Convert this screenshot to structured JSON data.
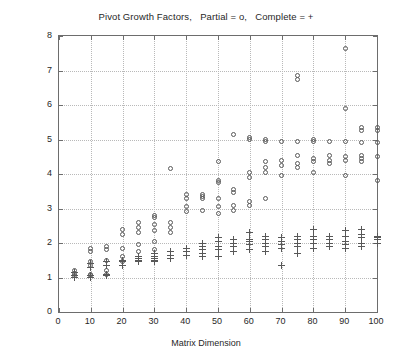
{
  "chart_data": {
    "type": "scatter",
    "title": "Pivot Growth Factors,   Partial = o,   Complete = +",
    "xlabel": "Matrix Dimension",
    "ylabel": "",
    "xlim": [
      0,
      100
    ],
    "ylim": [
      0,
      8
    ],
    "xticks": [
      0,
      10,
      20,
      30,
      40,
      50,
      60,
      70,
      80,
      90,
      100
    ],
    "yticks": [
      0,
      1,
      2,
      3,
      4,
      5,
      6,
      7,
      8
    ],
    "grid": true,
    "legend_position": "in-title",
    "marker_color": "#585858",
    "axis_color": "#6d6d6d",
    "grid_color": "#b9b9b9",
    "series": [
      {
        "name": "Partial",
        "marker": "o",
        "legend_text": "Partial = o",
        "points": [
          [
            5,
            1.05
          ],
          [
            5,
            1.12
          ],
          [
            5,
            1.2
          ],
          [
            10,
            1.05
          ],
          [
            10,
            1.1
          ],
          [
            10,
            1.35
          ],
          [
            10,
            1.45
          ],
          [
            10,
            1.75
          ],
          [
            10,
            1.85
          ],
          [
            15,
            1.1
          ],
          [
            15,
            1.2
          ],
          [
            15,
            1.5
          ],
          [
            15,
            1.8
          ],
          [
            15,
            1.9
          ],
          [
            20,
            1.45
          ],
          [
            20,
            1.6
          ],
          [
            20,
            1.85
          ],
          [
            20,
            2.25
          ],
          [
            20,
            2.4
          ],
          [
            25,
            1.75
          ],
          [
            25,
            1.95
          ],
          [
            25,
            2.3
          ],
          [
            25,
            2.45
          ],
          [
            25,
            2.6
          ],
          [
            30,
            1.8
          ],
          [
            30,
            2.05
          ],
          [
            30,
            2.35
          ],
          [
            30,
            2.55
          ],
          [
            30,
            2.75
          ],
          [
            30,
            2.8
          ],
          [
            35,
            2.3
          ],
          [
            35,
            2.45
          ],
          [
            35,
            2.6
          ],
          [
            35,
            4.15
          ],
          [
            40,
            2.9
          ],
          [
            40,
            3.05
          ],
          [
            40,
            3.3
          ],
          [
            40,
            3.4
          ],
          [
            45,
            2.95
          ],
          [
            45,
            3.3
          ],
          [
            45,
            3.35
          ],
          [
            45,
            3.4
          ],
          [
            50,
            2.85
          ],
          [
            50,
            3.05
          ],
          [
            50,
            3.3
          ],
          [
            50,
            3.75
          ],
          [
            50,
            3.8
          ],
          [
            50,
            4.35
          ],
          [
            55,
            2.95
          ],
          [
            55,
            3.1
          ],
          [
            55,
            3.45
          ],
          [
            55,
            3.55
          ],
          [
            55,
            5.15
          ],
          [
            60,
            3.1
          ],
          [
            60,
            3.2
          ],
          [
            60,
            3.9
          ],
          [
            60,
            4.05
          ],
          [
            60,
            5.0
          ],
          [
            60,
            5.05
          ],
          [
            65,
            3.3
          ],
          [
            65,
            4.05
          ],
          [
            65,
            4.2
          ],
          [
            65,
            4.35
          ],
          [
            65,
            4.95
          ],
          [
            65,
            5.0
          ],
          [
            70,
            3.95
          ],
          [
            70,
            4.25
          ],
          [
            70,
            4.4
          ],
          [
            70,
            4.95
          ],
          [
            75,
            4.2
          ],
          [
            75,
            4.3
          ],
          [
            75,
            4.55
          ],
          [
            75,
            4.95
          ],
          [
            75,
            6.75
          ],
          [
            75,
            6.85
          ],
          [
            80,
            4.05
          ],
          [
            80,
            4.35
          ],
          [
            80,
            4.45
          ],
          [
            80,
            4.95
          ],
          [
            80,
            5.0
          ],
          [
            85,
            4.3
          ],
          [
            85,
            4.4
          ],
          [
            85,
            4.55
          ],
          [
            85,
            4.95
          ],
          [
            90,
            3.95
          ],
          [
            90,
            4.4
          ],
          [
            90,
            4.5
          ],
          [
            90,
            4.95
          ],
          [
            90,
            5.9
          ],
          [
            90,
            7.65
          ],
          [
            95,
            4.35
          ],
          [
            95,
            4.45
          ],
          [
            95,
            4.55
          ],
          [
            95,
            4.9
          ],
          [
            95,
            5.25
          ],
          [
            95,
            5.35
          ],
          [
            100,
            3.8
          ],
          [
            100,
            4.5
          ],
          [
            100,
            4.9
          ],
          [
            100,
            5.25
          ],
          [
            100,
            5.35
          ]
        ]
      },
      {
        "name": "Complete",
        "marker": "+",
        "legend_text": "Complete = +",
        "points": [
          [
            5,
            1.0
          ],
          [
            5,
            1.05
          ],
          [
            5,
            1.15
          ],
          [
            10,
            1.0
          ],
          [
            10,
            1.05
          ],
          [
            10,
            1.3
          ],
          [
            10,
            1.4
          ],
          [
            15,
            1.05
          ],
          [
            15,
            1.1
          ],
          [
            15,
            1.35
          ],
          [
            15,
            1.45
          ],
          [
            20,
            1.35
          ],
          [
            20,
            1.45
          ],
          [
            20,
            1.5
          ],
          [
            25,
            1.45
          ],
          [
            25,
            1.5
          ],
          [
            25,
            1.55
          ],
          [
            25,
            1.6
          ],
          [
            30,
            1.45
          ],
          [
            30,
            1.5
          ],
          [
            30,
            1.55
          ],
          [
            30,
            1.6
          ],
          [
            30,
            1.7
          ],
          [
            35,
            1.55
          ],
          [
            35,
            1.65
          ],
          [
            35,
            1.75
          ],
          [
            40,
            1.65
          ],
          [
            40,
            1.75
          ],
          [
            40,
            1.85
          ],
          [
            45,
            1.6
          ],
          [
            45,
            1.7
          ],
          [
            45,
            1.8
          ],
          [
            45,
            1.9
          ],
          [
            45,
            2.0
          ],
          [
            50,
            1.6
          ],
          [
            50,
            1.8
          ],
          [
            50,
            1.9
          ],
          [
            50,
            2.05
          ],
          [
            50,
            2.15
          ],
          [
            55,
            1.75
          ],
          [
            55,
            1.9
          ],
          [
            55,
            2.0
          ],
          [
            55,
            2.1
          ],
          [
            60,
            1.8
          ],
          [
            60,
            1.95
          ],
          [
            60,
            2.05
          ],
          [
            60,
            2.1
          ],
          [
            60,
            2.3
          ],
          [
            65,
            1.75
          ],
          [
            65,
            1.9
          ],
          [
            65,
            2.0
          ],
          [
            65,
            2.1
          ],
          [
            65,
            2.2
          ],
          [
            70,
            1.35
          ],
          [
            70,
            1.85
          ],
          [
            70,
            1.95
          ],
          [
            70,
            2.05
          ],
          [
            70,
            2.15
          ],
          [
            75,
            1.7
          ],
          [
            75,
            1.9
          ],
          [
            75,
            2.0
          ],
          [
            75,
            2.1
          ],
          [
            75,
            2.2
          ],
          [
            80,
            1.85
          ],
          [
            80,
            2.0
          ],
          [
            80,
            2.1
          ],
          [
            80,
            2.2
          ],
          [
            80,
            2.4
          ],
          [
            85,
            1.9
          ],
          [
            85,
            2.0
          ],
          [
            85,
            2.1
          ],
          [
            85,
            2.2
          ],
          [
            90,
            1.85
          ],
          [
            90,
            1.95
          ],
          [
            90,
            2.05
          ],
          [
            90,
            2.2
          ],
          [
            90,
            2.35
          ],
          [
            95,
            1.9
          ],
          [
            95,
            2.0
          ],
          [
            95,
            2.15
          ],
          [
            95,
            2.25
          ],
          [
            95,
            2.4
          ],
          [
            100,
            2.0
          ],
          [
            100,
            2.1
          ],
          [
            100,
            2.15
          ],
          [
            100,
            2.2
          ]
        ]
      }
    ]
  }
}
